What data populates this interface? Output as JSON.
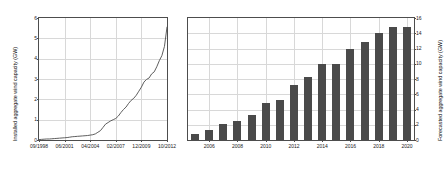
{
  "chart_data": [
    {
      "type": "line",
      "title": "",
      "xlabel": "",
      "ylabel": "Installed aggregate wind capacity (GW)",
      "ylim": [
        0,
        6
      ],
      "yticks": [
        0,
        1,
        2,
        3,
        4,
        5,
        6
      ],
      "xtick_labels": [
        "09/1998",
        "06/2001",
        "04/2004",
        "02/2007",
        "12/2009",
        "10/2012"
      ],
      "xlim_labels": [
        "09/1998",
        "10/2012"
      ],
      "grid": true,
      "legend": "none",
      "series": [
        {
          "name": "Installed aggregate wind capacity",
          "color": "#4d4d4d",
          "x": [
            0,
            2,
            4,
            6,
            8,
            10,
            12,
            14,
            16,
            18,
            20,
            22,
            24,
            26,
            28,
            30,
            32,
            34,
            36,
            38,
            40,
            42,
            44,
            46,
            48,
            50,
            52,
            54,
            56,
            58,
            60,
            62,
            64,
            66,
            68,
            70,
            72,
            74,
            76,
            78,
            80,
            82,
            84,
            86,
            88,
            90,
            92,
            94,
            96,
            98,
            100
          ],
          "y": [
            0.02,
            0.03,
            0.04,
            0.05,
            0.05,
            0.06,
            0.07,
            0.08,
            0.09,
            0.1,
            0.11,
            0.12,
            0.14,
            0.16,
            0.17,
            0.18,
            0.19,
            0.2,
            0.21,
            0.22,
            0.24,
            0.26,
            0.3,
            0.38,
            0.46,
            0.62,
            0.78,
            0.86,
            0.94,
            1.0,
            1.06,
            1.18,
            1.35,
            1.5,
            1.62,
            1.8,
            1.95,
            2.05,
            2.2,
            2.4,
            2.6,
            2.85,
            2.98,
            3.05,
            3.25,
            3.35,
            3.6,
            3.9,
            4.15,
            4.6,
            5.55
          ]
        }
      ]
    },
    {
      "type": "bar",
      "title": "",
      "xlabel": "",
      "ylabel": "Forecasted aggregate wind capacity (GW)",
      "ylim": [
        0,
        16
      ],
      "yticks": [
        0,
        2,
        4,
        6,
        8,
        10,
        12,
        14,
        16
      ],
      "ylabel_side": "right",
      "grid": true,
      "legend": "none",
      "bar_color": "#4a4a4a",
      "categories": [
        "2005",
        "2006",
        "2007",
        "2008",
        "2009",
        "2010",
        "2011",
        "2012",
        "2013",
        "2014",
        "2015",
        "2016",
        "2017",
        "2018",
        "2019",
        "2020"
      ],
      "xtick_labels": [
        "2006",
        "2008",
        "2010",
        "2012",
        "2014",
        "2016",
        "2018",
        "2020"
      ],
      "values": [
        0.8,
        1.3,
        2.1,
        2.5,
        3.3,
        4.9,
        5.3,
        7.2,
        8.2,
        10.0,
        10.0,
        11.9,
        12.9,
        14.1,
        14.8,
        14.8
      ]
    }
  ]
}
